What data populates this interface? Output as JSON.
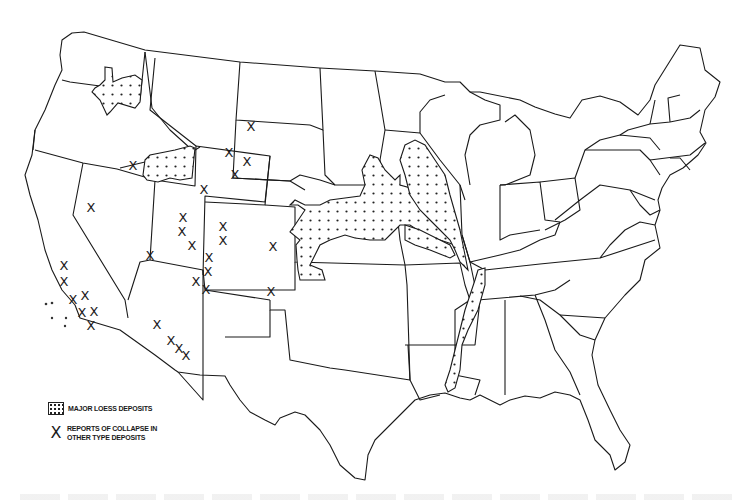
{
  "figure": {
    "colors": {
      "line": "#1a1a1a",
      "background": "#ffffff"
    }
  },
  "legend": {
    "items": [
      {
        "symbol": "dotted-pattern",
        "label": "MAJOR LOESS DEPOSITS"
      },
      {
        "symbol": "X",
        "label_line1": "REPORTS OF COLLAPSE IN",
        "label_line2": "OTHER TYPE DEPOSITS"
      }
    ]
  },
  "map": {
    "loess_regions": [
      "Palouse (eastern Washington / Idaho)",
      "Snake River Plain (southern Idaho)",
      "Central Plains (Nebraska / Kansas / Iowa / Missouri)",
      "Upper Mississippi Valley (Iowa / Minnesota / Wisconsin / Illinois)",
      "Lower Mississippi Valley (Mississippi / Tennessee / Louisiana)"
    ],
    "collapse_marker": "X",
    "collapse_points": [
      {
        "x": 133,
        "y": 166
      },
      {
        "x": 251,
        "y": 127
      },
      {
        "x": 229,
        "y": 153
      },
      {
        "x": 247,
        "y": 162
      },
      {
        "x": 235,
        "y": 175
      },
      {
        "x": 204,
        "y": 190
      },
      {
        "x": 91,
        "y": 208
      },
      {
        "x": 183,
        "y": 218
      },
      {
        "x": 182,
        "y": 232
      },
      {
        "x": 192,
        "y": 246
      },
      {
        "x": 223,
        "y": 227
      },
      {
        "x": 223,
        "y": 241
      },
      {
        "x": 273,
        "y": 247
      },
      {
        "x": 150,
        "y": 256
      },
      {
        "x": 209,
        "y": 258
      },
      {
        "x": 208,
        "y": 272
      },
      {
        "x": 206,
        "y": 290
      },
      {
        "x": 196,
        "y": 282
      },
      {
        "x": 271,
        "y": 292
      },
      {
        "x": 64,
        "y": 266
      },
      {
        "x": 64,
        "y": 282
      },
      {
        "x": 73,
        "y": 300
      },
      {
        "x": 85,
        "y": 296
      },
      {
        "x": 82,
        "y": 313
      },
      {
        "x": 94,
        "y": 312
      },
      {
        "x": 91,
        "y": 326
      },
      {
        "x": 157,
        "y": 325
      },
      {
        "x": 171,
        "y": 341
      },
      {
        "x": 179,
        "y": 349
      },
      {
        "x": 186,
        "y": 356
      }
    ]
  },
  "caption": {
    "visible_text": ""
  }
}
